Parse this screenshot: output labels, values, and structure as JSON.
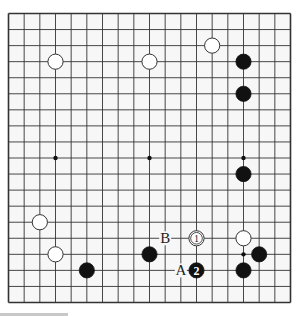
{
  "board": {
    "size": 19,
    "background": "#f7f7f7",
    "line_color": "#333333",
    "hoshi": [
      [
        3,
        3
      ],
      [
        3,
        9
      ],
      [
        3,
        15
      ],
      [
        9,
        3
      ],
      [
        9,
        9
      ],
      [
        9,
        15
      ],
      [
        15,
        3
      ],
      [
        15,
        9
      ],
      [
        15,
        15
      ]
    ],
    "stones": [
      {
        "color": "white",
        "col": 3,
        "row": 3,
        "label": ""
      },
      {
        "color": "white",
        "col": 9,
        "row": 3,
        "label": ""
      },
      {
        "color": "white",
        "col": 13,
        "row": 2,
        "label": ""
      },
      {
        "color": "black",
        "col": 15,
        "row": 3,
        "label": ""
      },
      {
        "color": "black",
        "col": 15,
        "row": 5,
        "label": ""
      },
      {
        "color": "black",
        "col": 15,
        "row": 10,
        "label": ""
      },
      {
        "color": "white",
        "col": 2,
        "row": 13,
        "label": ""
      },
      {
        "color": "white",
        "col": 3,
        "row": 15,
        "label": ""
      },
      {
        "color": "black",
        "col": 5,
        "row": 16,
        "label": ""
      },
      {
        "color": "black",
        "col": 9,
        "row": 15,
        "label": ""
      },
      {
        "color": "white",
        "col": 12,
        "row": 14,
        "label": "1"
      },
      {
        "color": "black",
        "col": 12,
        "row": 16,
        "label": "2"
      },
      {
        "color": "white",
        "col": 15,
        "row": 14,
        "label": ""
      },
      {
        "color": "black",
        "col": 16,
        "row": 15,
        "label": ""
      },
      {
        "color": "black",
        "col": 15,
        "row": 16,
        "label": ""
      }
    ],
    "markers": [
      {
        "text": "B",
        "col": 10,
        "row": 14
      },
      {
        "text": "A",
        "col": 11,
        "row": 16
      }
    ]
  }
}
